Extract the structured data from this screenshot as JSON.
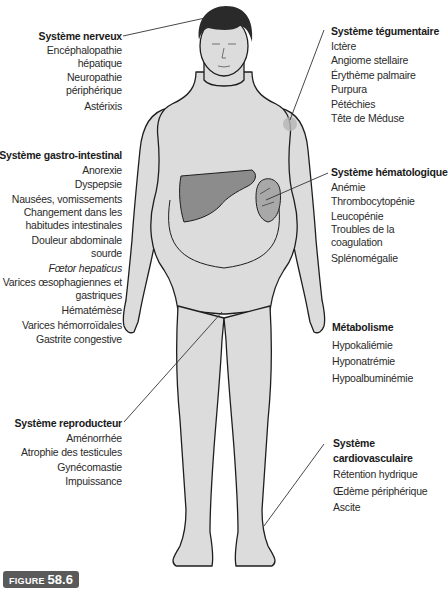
{
  "figure": {
    "label_prefix": "FIGURE",
    "label_number": "58.6"
  },
  "colors": {
    "skin": "#dcdcdc",
    "outline": "#1e1e1e",
    "liver": "#8c8c8c",
    "spleen": "#a8a8a8",
    "label_bg": "#5a5a5a"
  },
  "groups": {
    "nerveux": {
      "title": "Système nerveux",
      "items": [
        "Encéphalopathie hépatique",
        "Neuropathie périphérique",
        "Astérixis"
      ]
    },
    "gastro": {
      "title": "Système gastro-intestinal",
      "items": [
        "Anorexie",
        "Dyspepsie",
        "Nausées, vomissements",
        "Changement dans les habitudes intestinales",
        "Douleur abdominale sourde",
        "Fœtor hepaticus",
        "Varices œsophagiennes et gastriques",
        "Hématémèse",
        "Varices hémorroïdales",
        "Gastrite congestive"
      ]
    },
    "reproducteur": {
      "title": "Système reproducteur",
      "items": [
        "Aménorrhée",
        "Atrophie des testicules",
        "Gynécomastie",
        "Impuissance"
      ]
    },
    "tegumentaire": {
      "title": "Système tégumentaire",
      "items": [
        "Ictère",
        "Angiome stellaire",
        "Érythème palmaire",
        "Purpura",
        "Pétéchies",
        "Tête de Méduse"
      ]
    },
    "hemato": {
      "title": "Système hématologique",
      "items": [
        "Anémie",
        "Thrombocytopénie",
        "Leucopénie",
        "Troubles de la coagulation",
        "Splénomégalie"
      ]
    },
    "metabolisme": {
      "title": "Métabolisme",
      "items": [
        "Hypokaliémie",
        "Hyponatrémie",
        "Hypoalbuminémie"
      ]
    },
    "cardio": {
      "title": "Système cardiovasculaire",
      "items": [
        "Rétention hydrique",
        "Œdème périphérique",
        "Ascite"
      ]
    }
  }
}
